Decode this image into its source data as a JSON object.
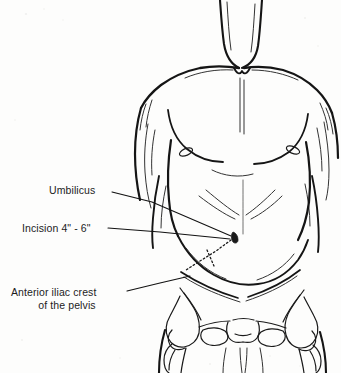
{
  "figure": {
    "medium": "scanned line drawing",
    "background_color": "#fdfdfc",
    "ink_color": "#151515",
    "text_color": "#1c1c1c"
  },
  "labels": {
    "umbilicus": {
      "text": "Umbilicus",
      "points_to": "navel"
    },
    "incision": {
      "text": "Incision 4\" - 6\"",
      "points_to": "dotted incision line"
    },
    "iliac_crest": {
      "line_1": "Anterior iliac crest",
      "line_2": "of the pelvis",
      "points_to": "left anterior superior iliac spine"
    }
  },
  "annotations": {
    "incision_line_style": "dotted",
    "leader_line_style": "solid thin"
  }
}
